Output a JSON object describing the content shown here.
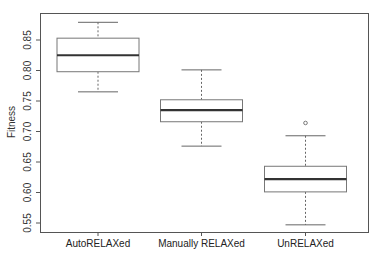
{
  "chart_data": {
    "type": "boxplot",
    "title": "",
    "xlabel": "",
    "ylabel": "Fitness",
    "ylim": [
      0.535,
      0.895
    ],
    "yticks": [
      0.55,
      0.6,
      0.65,
      0.7,
      0.75,
      0.8,
      0.85
    ],
    "ytick_labels": [
      "0.55",
      "0.60",
      "0.65",
      "0.70",
      "0.75",
      "0.80",
      "0.85"
    ],
    "grid": false,
    "categories": [
      "AutoRELAXed",
      "Manually RELAXed",
      "UnRELAXed"
    ],
    "series": [
      {
        "name": "AutoRELAXed",
        "whisker_low": 0.765,
        "q1": 0.798,
        "median": 0.825,
        "q3": 0.853,
        "whisker_high": 0.879,
        "outliers": []
      },
      {
        "name": "Manually RELAXed",
        "whisker_low": 0.676,
        "q1": 0.716,
        "median": 0.735,
        "q3": 0.752,
        "whisker_high": 0.801,
        "outliers": []
      },
      {
        "name": "UnRELAXed",
        "whisker_low": 0.547,
        "q1": 0.601,
        "median": 0.622,
        "q3": 0.643,
        "whisker_high": 0.693,
        "outliers": [
          0.714
        ]
      }
    ]
  }
}
